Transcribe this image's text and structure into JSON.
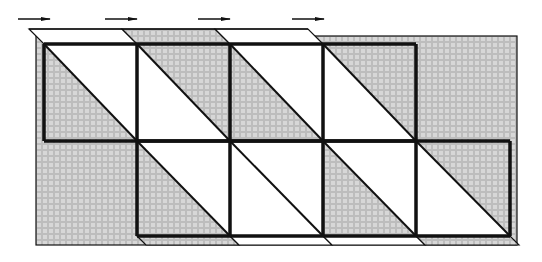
{
  "diagram": {
    "colors": {
      "hatch_bg": "#bdbdbd",
      "hatch_line": "#f2f2f2",
      "stroke": "#111111",
      "white": "#ffffff"
    },
    "arrows": [
      {
        "x1": 18,
        "x2": 50,
        "y": 19
      },
      {
        "x1": 105,
        "x2": 137,
        "y": 19
      },
      {
        "x1": 198,
        "x2": 230,
        "y": 19
      },
      {
        "x1": 292,
        "x2": 324,
        "y": 19
      }
    ],
    "background_rect": {
      "x1": 36,
      "y1": 36,
      "x2": 517,
      "y2": 245
    },
    "top_band": {
      "y_top": 29,
      "y_bottom": 44,
      "shift": 15,
      "segments": [
        {
          "x": 29,
          "w": 93,
          "fill": "white"
        },
        {
          "x": 122,
          "w": 93,
          "fill": "hatch"
        },
        {
          "x": 215,
          "w": 93,
          "fill": "white"
        }
      ]
    },
    "bottom_band": {
      "y_top": 236,
      "y_bottom": 245,
      "shift": 9,
      "segments": [
        {
          "x": 137,
          "w": 93,
          "fill": "hatch"
        },
        {
          "x": 230,
          "w": 93,
          "fill": "white"
        },
        {
          "x": 323,
          "w": 93,
          "fill": "white"
        },
        {
          "x": 416,
          "w": 94,
          "fill": "hatch"
        }
      ]
    },
    "grid": {
      "row_top": {
        "y1": 44,
        "y2": 141,
        "columns": [
          44,
          137,
          230,
          323,
          416
        ]
      },
      "row_bottom": {
        "y1": 141,
        "y2": 236,
        "columns": [
          137,
          230,
          323,
          416,
          510
        ]
      }
    },
    "cells": [
      {
        "row": "top",
        "x1": 44,
        "x2": 137,
        "lower_left": "hatch",
        "upper_right": "white"
      },
      {
        "row": "top",
        "x1": 137,
        "x2": 230,
        "lower_left": "white",
        "upper_right": "hatch"
      },
      {
        "row": "top",
        "x1": 230,
        "x2": 323,
        "lower_left": "hatch",
        "upper_right": "white"
      },
      {
        "row": "top",
        "x1": 323,
        "x2": 416,
        "lower_left": "white",
        "upper_right": "hatch"
      },
      {
        "row": "bottom",
        "x1": 137,
        "x2": 230,
        "lower_left": "hatch",
        "upper_right": "white"
      },
      {
        "row": "bottom",
        "x1": 230,
        "x2": 323,
        "lower_left": "white",
        "upper_right": "white"
      },
      {
        "row": "bottom",
        "x1": 323,
        "x2": 416,
        "lower_left": "hatch",
        "upper_right": "white"
      },
      {
        "row": "bottom",
        "x1": 416,
        "x2": 510,
        "lower_left": "white",
        "upper_right": "hatch"
      }
    ]
  }
}
